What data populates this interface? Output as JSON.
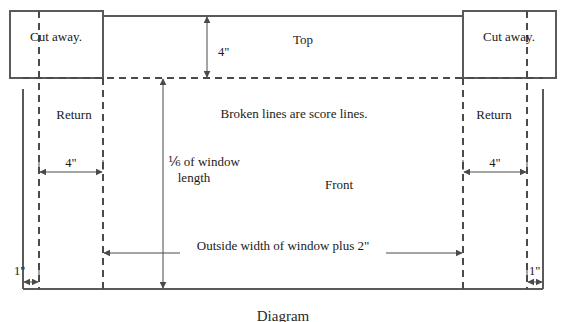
{
  "figure": {
    "caption": "Diagram",
    "note": "Broken lines are score lines."
  },
  "panels": {
    "top": "Top",
    "front": "Front",
    "return_left": "Return",
    "return_right": "Return",
    "cut_away_left": "Cut away.",
    "cut_away_right": "Cut away."
  },
  "dimensions": {
    "top_depth": "4\"",
    "return_width_left": "4\"",
    "return_width_right": "4\"",
    "front_height": "⅙ of window length",
    "front_height_line1": "⅙ of window",
    "front_height_line2": "length",
    "front_width": "Outside width of window plus 2\"",
    "edge_left": "1\"",
    "edge_right": "1\""
  },
  "colors": {
    "solid_stroke": "#5a5a5a",
    "score_stroke": "#4a4a4a",
    "dimension_stroke": "#4a4a4a",
    "text": "#1a1a1a",
    "background": "#ffffff"
  }
}
